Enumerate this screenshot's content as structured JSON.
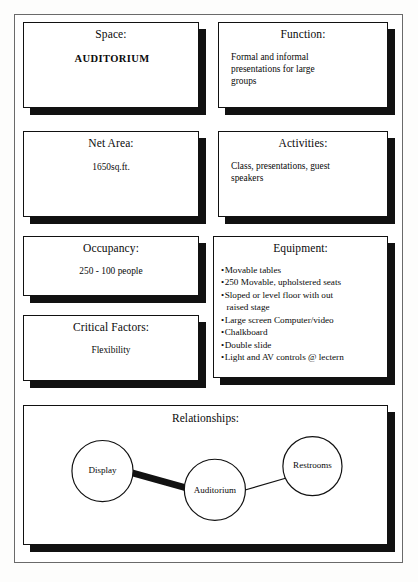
{
  "sheet": {
    "cards": [
      {
        "id": "space",
        "title": "Space:",
        "value": "AUDITORIUM"
      },
      {
        "id": "function",
        "title": "Function:",
        "value": "Formal and informal presentations for large groups"
      },
      {
        "id": "net-area",
        "title": "Net Area:",
        "value": "1650sq.ft."
      },
      {
        "id": "activities",
        "title": "Activities:",
        "value": "Class, presentations, guest speakers"
      },
      {
        "id": "occupancy",
        "title": "Occupancy:",
        "value": "250 - 100 people"
      },
      {
        "id": "critical-factors",
        "title": "Critical Factors:",
        "value": "Flexibility"
      },
      {
        "id": "equipment",
        "title": "Equipment:",
        "items": [
          "Movable tables",
          "250 Movable, upholstered seats",
          "Sloped or level floor with out",
          "raised stage",
          "Large screen Computer/video",
          "Chalkboard",
          "Double slide",
          "Light and AV controls @ lectern"
        ]
      },
      {
        "id": "relationships",
        "title": "Relationships:"
      }
    ]
  },
  "relationships": {
    "title": "Relationships:",
    "nodes": [
      {
        "id": "display",
        "label": "Display"
      },
      {
        "id": "auditorium",
        "label": "Auditorium"
      },
      {
        "id": "restrooms",
        "label": "Restrooms"
      }
    ],
    "links": [
      {
        "from": "display",
        "to": "auditorium",
        "strength": "strong"
      },
      {
        "from": "auditorium",
        "to": "restrooms",
        "strength": "weak"
      }
    ]
  },
  "colors": {
    "ink": "#0a0a0a",
    "shadow": "#111111",
    "paper": "#ffffff",
    "frame": "#6a6a6a"
  }
}
